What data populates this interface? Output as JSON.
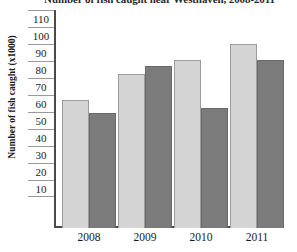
{
  "chart_data": {
    "type": "bar",
    "title": "Number of fish caught near Westhaven, 2008-2011",
    "xlabel": "",
    "ylabel": "Number of fish caught (x1000)",
    "categories": [
      "2008",
      "2009",
      "2010",
      "2011"
    ],
    "ylim": [
      0,
      118
    ],
    "yticks": [
      110,
      100,
      90,
      80,
      70,
      60,
      50,
      40,
      30,
      20,
      10
    ],
    "grid": true,
    "legend": "none",
    "series": [
      {
        "name": "light-series",
        "color": "#d4d4d4",
        "values": [
          80,
          96,
          105,
          115
        ]
      },
      {
        "name": "dark-series",
        "color": "#7b7b7b",
        "values": [
          72,
          101,
          75,
          105
        ]
      }
    ]
  },
  "colors": {
    "light_bar": "#d4d4d4",
    "dark_bar": "#7b7b7b",
    "axis": "#4a4a4a",
    "gridline": "#9a9a9a",
    "text": "#1a1a1a",
    "background": "#ffffff"
  }
}
